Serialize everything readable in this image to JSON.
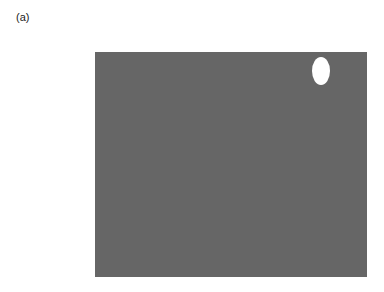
{
  "panel_label": "(a)",
  "figure": {
    "background_color": "#666666",
    "spot": {
      "color": "#ffffff",
      "cx": 226,
      "cy": 19,
      "rx": 9,
      "ry": 14
    }
  }
}
